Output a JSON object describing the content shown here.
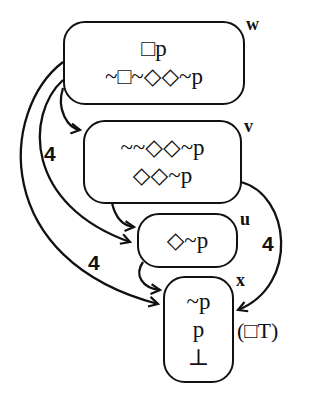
{
  "diagram": {
    "type": "kripke-model",
    "worlds": [
      {
        "id": "w",
        "label": "w",
        "formulas": [
          "□p",
          "~□~◇◇~p"
        ]
      },
      {
        "id": "v",
        "label": "v",
        "formulas": [
          "~~◇◇~p",
          "◇◇~p"
        ]
      },
      {
        "id": "u",
        "label": "u",
        "formulas": [
          "◇~p"
        ]
      },
      {
        "id": "x",
        "label": "x",
        "formulas": [
          "~p",
          "p",
          "⊥"
        ]
      }
    ],
    "edges": [
      {
        "from": "w",
        "to": "v",
        "label": ""
      },
      {
        "from": "w",
        "to": "u",
        "label": "4"
      },
      {
        "from": "w",
        "to": "x",
        "label": "4"
      },
      {
        "from": "v",
        "to": "u",
        "label": ""
      },
      {
        "from": "v",
        "to": "x",
        "label": "4"
      },
      {
        "from": "u",
        "to": "x",
        "label": ""
      }
    ],
    "annotation": "(□T)",
    "colors": {
      "stroke": "#111111",
      "background": "#ffffff"
    }
  }
}
